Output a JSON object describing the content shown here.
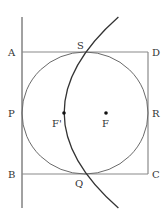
{
  "diagram": {
    "type": "geometry",
    "colors": {
      "square": "#8a8a8a",
      "circle": "#6a6a6a",
      "parabola": "#333333",
      "directrix": "#444444",
      "points": "#111111",
      "labels": "#333333"
    },
    "labels": {
      "A": "A",
      "B": "B",
      "C": "C",
      "D": "D",
      "P": "P",
      "Q": "Q",
      "R": "R",
      "S": "S",
      "F": "F",
      "F_prime": "F'"
    },
    "points": {
      "A": [
        22,
        52
      ],
      "B": [
        22,
        174
      ],
      "C": [
        148,
        174
      ],
      "D": [
        148,
        52
      ],
      "circle_center": [
        85,
        113
      ],
      "F_prime": [
        64,
        113
      ],
      "F": [
        106,
        113
      ]
    }
  }
}
